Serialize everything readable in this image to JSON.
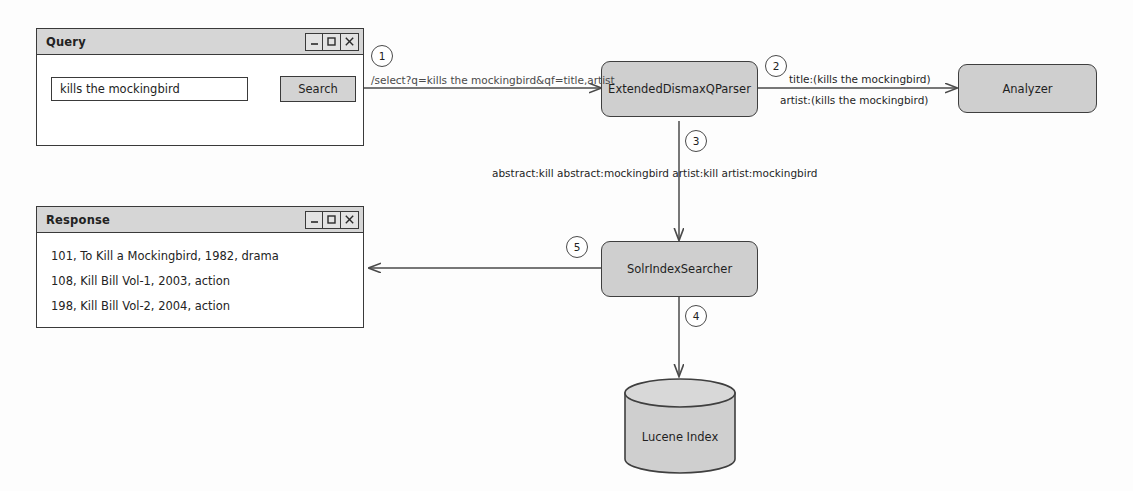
{
  "diagram": {
    "background_color": "#fdfdfd",
    "box_fill": "#cfcfcf",
    "line_color": "#4a4a4a"
  },
  "query_window": {
    "title": "Query",
    "window_buttons": [
      {
        "name": "minimize",
        "glyph": "_"
      },
      {
        "name": "maximize",
        "glyph": "□"
      },
      {
        "name": "close",
        "glyph": "✕"
      }
    ],
    "search_input": {
      "value": "kills the mockingbird",
      "placeholder": "kills the mockingbird"
    },
    "search_button": "Search"
  },
  "response_window": {
    "title": "Response",
    "window_buttons": [
      {
        "name": "minimize",
        "glyph": "_"
      },
      {
        "name": "maximize",
        "glyph": "□"
      },
      {
        "name": "close",
        "glyph": "✕"
      }
    ],
    "rows": [
      "101, To Kill a Mockingbird, 1982, drama",
      "108, Kill Bill Vol-1, 2003, action",
      "198, Kill Bill Vol-2, 2004, action"
    ]
  },
  "nodes": {
    "parser": "ExtendedDismaxQParser",
    "analyzer": "Analyzer",
    "searcher": "SolrIndexSearcher",
    "index": "Lucene Index"
  },
  "steps": {
    "one": "1",
    "two": "2",
    "three": "3",
    "four": "4",
    "five": "5"
  },
  "edges": {
    "request_url": "/select?q=kills the mockingbird&qf=title,artist",
    "analyze_title": "title:(kills the mockingbird)",
    "analyze_artist": "artist:(kills the mockingbird)",
    "analyzed_query": "abstract:kill abstract:mockingbird artist:kill artist:mockingbird"
  }
}
